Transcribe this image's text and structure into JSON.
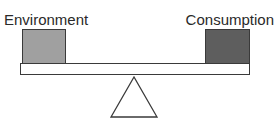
{
  "diagram": {
    "type": "balance-scale",
    "left": {
      "label": "Environment",
      "color": "#a0a0a0"
    },
    "right": {
      "label": "Consumption",
      "color": "#5e5e5e"
    },
    "beam_color": "#ffffff",
    "outline_color": "#3a3a3a"
  }
}
